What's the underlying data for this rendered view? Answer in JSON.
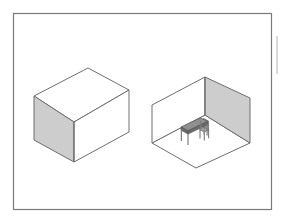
{
  "figure": {
    "background_color": "#ffffff",
    "frame": {
      "label": "figure-border",
      "x": 13,
      "y": 13,
      "width": 259,
      "height": 197,
      "stroke_color": "#7a7a7a",
      "fill_color": "#ffffff",
      "stroke_width": 1.2
    },
    "edge_mark": {
      "label": "right-edge-tick",
      "x": 277,
      "y1": 36,
      "y2": 74,
      "stroke_color": "#b4b4b4"
    },
    "palette": {
      "outline": "#6e6e6e",
      "outline_light": "#8a8a8a",
      "face_light": "#ffffff",
      "face_shaded": "#cdcdcd",
      "face_shaded_soft": "#d6d6d6",
      "furniture_dark": "#6b6b6b",
      "furniture_mid": "#8f8f8f",
      "furniture_light": "#a8a8a8"
    },
    "objects": [
      {
        "name": "closed-box",
        "kind": "solid-cuboid",
        "description": "Closed rectangular box drawn in isometric projection, left face shaded gray, top and front faces white",
        "vertices": {
          "top_back": [
            88,
            68
          ],
          "top_left": [
            34,
            96
          ],
          "top_front": [
            74,
            122
          ],
          "top_right": [
            129,
            90
          ],
          "bottom_left": [
            34,
            140
          ],
          "bottom_front": [
            74,
            162
          ],
          "bottom_right": [
            129,
            132
          ]
        },
        "faces": [
          {
            "name": "top-face",
            "fill": "#ffffff"
          },
          {
            "name": "left-face",
            "fill": "#cdcdcd"
          },
          {
            "name": "right-face",
            "fill": "#ffffff"
          }
        ]
      },
      {
        "name": "open-room",
        "kind": "two-wall-room",
        "description": "Open room with floor and two standing walls; right wall shaded gray, back-left wall white, containing a table and a chair",
        "vertices": {
          "floor_left": [
            152,
            143
          ],
          "floor_back": [
            205,
            115
          ],
          "floor_right": [
            250,
            143
          ],
          "floor_front": [
            196,
            168
          ],
          "wall_left_top_outer": [
            152,
            105
          ],
          "wall_back_top": [
            205,
            77
          ],
          "wall_right_top_outer": [
            250,
            98
          ]
        },
        "faces": [
          {
            "name": "floor-face",
            "fill": "#ffffff"
          },
          {
            "name": "back-left-wall-face",
            "fill": "#ffffff"
          },
          {
            "name": "right-wall-face",
            "fill": "#cdcdcd"
          }
        ]
      },
      {
        "name": "table",
        "kind": "furniture",
        "description": "Rectangular table with four legs, dark gray top, placed on the room floor",
        "top_color": "#8f8f8f",
        "side_color": "#6b6b6b",
        "leg_color": "#7c7c7c"
      },
      {
        "name": "chair",
        "kind": "furniture",
        "description": "Small chair with upright back positioned at the right end of the table",
        "seat_color": "#a8a8a8",
        "back_color": "#9a9a9a",
        "leg_color": "#7c7c7c"
      }
    ]
  }
}
